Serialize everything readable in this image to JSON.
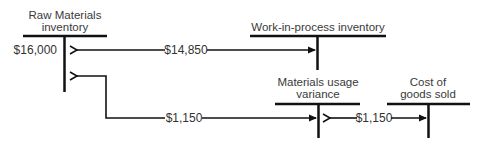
{
  "diagram": {
    "type": "t-account flow",
    "accounts": [
      {
        "id": "raw_materials",
        "label_line1": "Raw Materials",
        "label_line2": "inventory",
        "debit_entry": "$16,000"
      },
      {
        "id": "wip",
        "label_line1": "Work-in-process inventory"
      },
      {
        "id": "variance",
        "label_line1": "Materials usage",
        "label_line2": "variance"
      },
      {
        "id": "cogs",
        "label_line1": "Cost of",
        "label_line2": "goods sold"
      }
    ],
    "flows": [
      {
        "from": "raw_materials",
        "to": "wip",
        "amount": "$14,850"
      },
      {
        "from": "raw_materials",
        "to": "variance",
        "amount": "$1,150"
      },
      {
        "from": "variance",
        "to": "cogs",
        "amount": "$1,150"
      }
    ],
    "colors": {
      "line": "#111111",
      "text": "#3a3a3a",
      "background": "#ffffff"
    }
  }
}
